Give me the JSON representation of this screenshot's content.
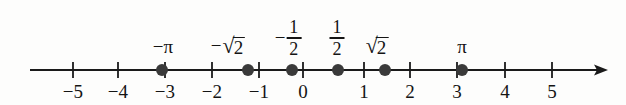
{
  "figure": {
    "type": "number-line",
    "axis": {
      "color": "#1a1a1a",
      "min": -5,
      "max": 5,
      "origin_x_px": 301,
      "unit_px": 48,
      "line_y_px": 70,
      "start_x_px": 30,
      "arrow_tip_x_px": 608,
      "has_right_arrow": true,
      "has_left_arrow": false
    },
    "ticks": [
      {
        "value": -5,
        "label": "−5",
        "x_px": 73
      },
      {
        "value": -4,
        "label": "−4",
        "x_px": 118
      },
      {
        "value": -3,
        "label": "−3",
        "x_px": 165
      },
      {
        "value": -2,
        "label": "−2",
        "x_px": 212
      },
      {
        "value": -1,
        "label": "−1",
        "x_px": 259
      },
      {
        "value": 0,
        "label": "0",
        "x_px": 303
      },
      {
        "value": 1,
        "label": "1",
        "x_px": 364
      },
      {
        "value": 2,
        "label": "2",
        "x_px": 410
      },
      {
        "value": 3,
        "label": "3",
        "x_px": 457
      },
      {
        "value": 4,
        "label": "4",
        "x_px": 505
      },
      {
        "value": 5,
        "label": "5",
        "x_px": 552
      }
    ],
    "points": [
      {
        "name": "negative-pi",
        "label_kind": "simple",
        "label": "−π",
        "value": -3.14159,
        "dot_x_px": 162,
        "label_x_px": 163
      },
      {
        "name": "negative-sqrt-2",
        "label_kind": "radical",
        "label": "−√2",
        "sign": "−",
        "radicand": "2",
        "value": -1.41421,
        "dot_x_px": 248,
        "label_x_px": 228
      },
      {
        "name": "negative-one-half",
        "label_kind": "fraction",
        "label": "−1/2",
        "sign": "−",
        "numerator": "1",
        "denominator": "2",
        "value": -0.5,
        "dot_x_px": 292,
        "label_x_px": 288
      },
      {
        "name": "positive-one-half",
        "label_kind": "fraction",
        "label": "1/2",
        "sign": "",
        "numerator": "1",
        "denominator": "2",
        "value": 0.5,
        "dot_x_px": 338,
        "label_x_px": 337
      },
      {
        "name": "positive-sqrt-2",
        "label_kind": "radical",
        "label": "√2",
        "sign": "",
        "radicand": "2",
        "value": 1.41421,
        "dot_x_px": 385,
        "label_x_px": 377
      },
      {
        "name": "positive-pi",
        "label_kind": "simple",
        "label": "π",
        "value": 3.14159,
        "dot_x_px": 462,
        "label_x_px": 462
      }
    ],
    "style": {
      "dot_color": "#3a3a3a",
      "dot_radius_px": 6,
      "text_color": "#141414",
      "background": "#fdfdfc",
      "line_width_px": 2,
      "tick_height_px": 16
    },
    "radical_glyph": "√"
  }
}
